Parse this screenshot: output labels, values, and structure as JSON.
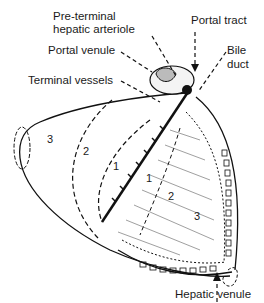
{
  "diagram": {
    "type": "anatomical",
    "labels": {
      "pre_terminal_line1": "Pre-terminal",
      "pre_terminal_line2": "hepatic arteriole",
      "portal_tract": "Portal tract",
      "portal_venule": "Portal venule",
      "bile_line1": "Bile",
      "bile_line2": "duct",
      "terminal_vessels": "Terminal vessels",
      "hepatic_venule": "Hepatic venule"
    },
    "zones_left": [
      "3",
      "2",
      "1"
    ],
    "zones_right": [
      "1",
      "2",
      "3"
    ]
  }
}
